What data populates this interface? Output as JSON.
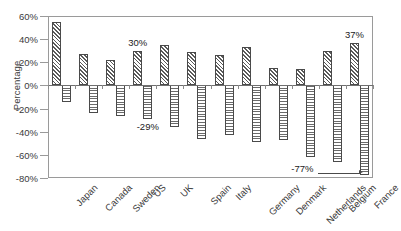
{
  "chart_data": {
    "type": "bar",
    "title": "",
    "xlabel": "",
    "ylabel": "Percentage",
    "ylim": [
      -80,
      60
    ],
    "ytick_labels": [
      "60%",
      "40%",
      "20%",
      "0%",
      "-20%",
      "-40%",
      "-60%",
      "-80%"
    ],
    "ytick_values": [
      60,
      40,
      20,
      0,
      -20,
      -40,
      -60,
      -80
    ],
    "grid": false,
    "legend": "none",
    "categories": [
      "Japan",
      "Canada",
      "Sweden",
      "US",
      "UK",
      "Spain",
      "Italy",
      "Germany",
      "Denmark",
      "Netherlands",
      "Belgium",
      "France"
    ],
    "series": [
      {
        "name": "positive",
        "pattern": "diagonal-hatch",
        "values": [
          55,
          27,
          22,
          30,
          35,
          29,
          26,
          33,
          15,
          14,
          30,
          37
        ]
      },
      {
        "name": "negative",
        "pattern": "horizontal-hatch",
        "values": [
          -14,
          -24,
          -26,
          -29,
          -36,
          -46,
          -43,
          -49,
          -47,
          -62,
          -66,
          -77
        ]
      }
    ],
    "annotations": [
      {
        "text": "30%",
        "category": "US",
        "value": 30,
        "position": "above-bar"
      },
      {
        "text": "-29%",
        "category": "US",
        "value": -29,
        "position": "below-bar"
      },
      {
        "text": "37%",
        "category": "France",
        "value": 37,
        "position": "above-bar"
      },
      {
        "text": "-77%",
        "category": "France",
        "value": -77,
        "position": "leader-left"
      }
    ]
  },
  "colors": {
    "axis": "#9a9a9a",
    "zero_line": "#6f6f6f",
    "bar_outline": "#4a4a4a",
    "text": "#3a3a3a",
    "background": "#ffffff"
  }
}
